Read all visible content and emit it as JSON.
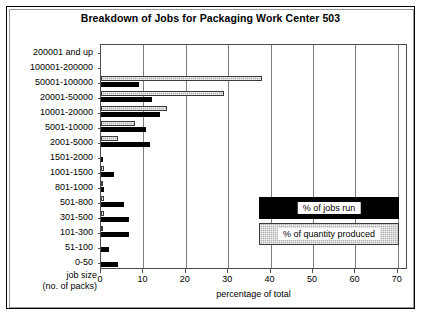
{
  "chart_data": {
    "type": "bar",
    "orientation": "horizontal",
    "title": "Breakdown of Jobs for Packaging Work Center 503",
    "xlabel": "percentage of total",
    "ylabel": "job size (no. of packs)",
    "ylabel_lines": [
      "job size",
      "(no. of packs)"
    ],
    "xlim": [
      0,
      72.4
    ],
    "xticks": [
      0,
      10,
      20,
      30,
      40,
      50,
      60,
      70
    ],
    "xtick_labels": [
      "0",
      "10",
      "20",
      "30",
      "40",
      "50",
      "60",
      "70"
    ],
    "grid": "vertical",
    "legend_position": "inside-right-lower",
    "categories": [
      "200001 and up",
      "100001-200000",
      "50001-100000",
      "20001-50000",
      "10001-20000",
      "5001-10000",
      "2001-5000",
      "1501-2000",
      "1001-1500",
      "801-1000",
      "501-800",
      "301-500",
      "101-300",
      "51-100",
      "0-50"
    ],
    "series": [
      {
        "name": "% of jobs run",
        "color": "#000000",
        "values": [
          0,
          0,
          9,
          12,
          14,
          10.5,
          11.5,
          0.5,
          3,
          0.6,
          5.5,
          6.5,
          6.5,
          2,
          4
        ]
      },
      {
        "name": "% of quantity produced",
        "color": "#b0b0b0",
        "values": [
          0,
          0,
          38,
          29,
          15.5,
          8,
          4,
          0,
          0.7,
          0.5,
          0.6,
          0.6,
          0.5,
          0,
          0
        ]
      }
    ]
  },
  "legend": {
    "items": [
      {
        "label": "% of jobs run",
        "style": "jobs"
      },
      {
        "label": "% of quantity produced",
        "style": "qty"
      }
    ]
  }
}
